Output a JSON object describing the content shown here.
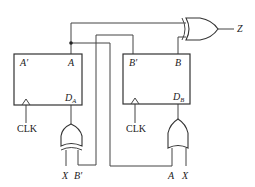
{
  "diagram": {
    "type": "sequential-circuit",
    "flipflops": [
      {
        "id": "A",
        "outputs": {
          "left": "A′",
          "right": "A"
        },
        "input": "D",
        "input_sub": "A",
        "clock": "CLK"
      },
      {
        "id": "B",
        "outputs": {
          "left": "B′",
          "right": "B"
        },
        "input": "D",
        "input_sub": "B",
        "clock": "CLK"
      }
    ],
    "gates": [
      {
        "id": "xor-a",
        "type": "XOR",
        "inputs": [
          "X",
          "B′"
        ],
        "output_to": "D_A"
      },
      {
        "id": "or-b",
        "type": "OR",
        "inputs": [
          "A",
          "X"
        ],
        "output_to": "D_B"
      },
      {
        "id": "xor-z",
        "type": "XOR",
        "inputs": [
          "A",
          "B"
        ],
        "output": "Z"
      }
    ],
    "labels": {
      "ffa_qbar": "A′",
      "ffa_q": "A",
      "ffa_d": "D",
      "ffa_d_sub": "A",
      "ffa_clk": "CLK",
      "ffb_qbar": "B′",
      "ffb_q": "B",
      "ffb_d": "D",
      "ffb_d_sub": "B",
      "ffb_clk": "CLK",
      "xor_a_in1": "X",
      "xor_a_in2": "B′",
      "or_b_in1": "A",
      "or_b_in2": "X",
      "output_z": "Z"
    }
  }
}
